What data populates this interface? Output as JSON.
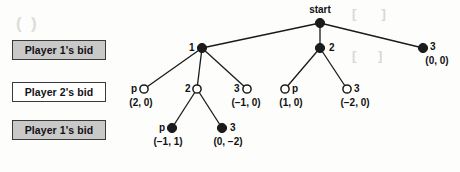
{
  "figure": {
    "type": "extensive-form-game-tree",
    "background_color": "#fdfdfc",
    "ink_color": "#1b1b1b"
  },
  "legend": {
    "items": [
      {
        "label": "Player 1's bid",
        "style": "filled",
        "fill": "#c9c9c9"
      },
      {
        "label": "Player 2's bid",
        "style": "plain",
        "fill": "#ffffff"
      },
      {
        "label": "Player 1's bid",
        "style": "filled",
        "fill": "#c9c9c9"
      }
    ]
  },
  "tree": {
    "root_label": "start",
    "nodes": {
      "start": {
        "label": "start",
        "marker": "filled",
        "payoff": ""
      },
      "l1_a": {
        "label": "1",
        "marker": "filled",
        "payoff": ""
      },
      "l1_b": {
        "label": "2",
        "marker": "filled",
        "payoff": ""
      },
      "l1_c": {
        "label": "3",
        "marker": "filled",
        "payoff": "(0, 0)"
      },
      "l2_a": {
        "label": "p",
        "marker": "open",
        "payoff": "(2, 0)"
      },
      "l2_b": {
        "label": "2",
        "marker": "open",
        "payoff": ""
      },
      "l2_c": {
        "label": "3",
        "marker": "open",
        "payoff": "(−1, 0)"
      },
      "l2_d": {
        "label": "p",
        "marker": "open",
        "payoff": "(1, 0)"
      },
      "l2_e": {
        "label": "3",
        "marker": "open",
        "payoff": "(−2, 0)"
      },
      "l3_a": {
        "label": "p",
        "marker": "filled",
        "payoff": "(−1, 1)"
      },
      "l3_b": {
        "label": "3",
        "marker": "filled",
        "payoff": "(0, −2)"
      }
    }
  },
  "artifacts": {
    "ghost_texts": [
      "",
      "",
      "",
      ""
    ]
  }
}
